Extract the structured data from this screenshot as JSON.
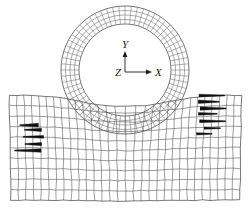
{
  "figure": {
    "background_color": "#ffffff",
    "line_color": "#3a3a3a",
    "dark_element_color": "#101010"
  },
  "axis_triad": {
    "name": "coordinate-triad",
    "origin_label": "Z",
    "vertical_label": "Y",
    "horizontal_label": "X",
    "origin_px": [
      125,
      72
    ],
    "y_arrow_length_px": 20,
    "x_arrow_length_px": 26
  },
  "tire": {
    "name": "tire-mesh",
    "center_px": [
      125,
      70
    ],
    "outer_radius_px": 64,
    "inner_radius_px": 46,
    "radial_layers": 4,
    "circumferential_divisions": 64,
    "contact_flat_y_px": 137,
    "description": "Annular tire cross-section mesh, flattened at the contact patch"
  },
  "soil": {
    "name": "soil-mesh",
    "left_px": 11,
    "right_px": 240,
    "top_px": 95,
    "bottom_px": 200,
    "columns": 30,
    "rows": 10,
    "description": "Rectangular soil block mesh, distorted beneath and beside the tire"
  },
  "distorted_zones": [
    {
      "name": "left-sliver-zone",
      "center_px": [
        42,
        140
      ],
      "count": 5,
      "note": "Collapsed dark sliver elements at left shear band"
    },
    {
      "name": "right-sliver-zone",
      "center_px": [
        200,
        117
      ],
      "count": 7,
      "note": "Collapsed dark sliver elements at right shear band"
    }
  ]
}
